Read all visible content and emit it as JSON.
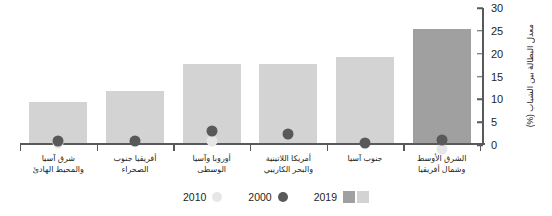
{
  "chart_data": {
    "type": "bar",
    "title": "",
    "xlabel": "",
    "ylabel": "معدل البطالة بين الشباب (%)",
    "ylim": [
      0,
      30
    ],
    "yticks": [
      0,
      5,
      10,
      15,
      20,
      25,
      30
    ],
    "grid": false,
    "legend_position": "bottom-center",
    "categories": [
      "شرق آسيا\nوالمحيط الهادئ",
      "أفريقيا جنوب\nالصحراء",
      "أوروبا وآسيا\nالوسطى",
      "أمريكا اللاتينية\nوالبحر الكاريبي",
      "جنوب آسيا",
      "الشرق الأوسط\nوشمال أفريقيا"
    ],
    "series": [
      {
        "name": "2019",
        "type": "bar",
        "values": [
          9.0,
          11.5,
          17.5,
          17.5,
          19.0,
          25.0
        ]
      },
      {
        "name": "2000",
        "type": "point",
        "values": [
          9.5,
          12.0,
          20.2,
          19.6,
          19.2,
          25.7
        ]
      },
      {
        "name": "2010",
        "type": "point",
        "values": [
          9.2,
          null,
          18.1,
          null,
          null,
          23.8
        ]
      }
    ]
  },
  "axis": {
    "y_title": "معدل البطالة بين الشباب (%)",
    "tick_labels": [
      "0",
      "5",
      "10",
      "15",
      "20",
      "25",
      "30"
    ],
    "category_labels": [
      {
        "line1": "شرق آسيا",
        "line2": "والمحيط الهادئ"
      },
      {
        "line1": "أفريقيا جنوب",
        "line2": "الصحراء"
      },
      {
        "line1": "أوروبا وآسيا",
        "line2": "الوسطى"
      },
      {
        "line1": "أمريكا اللاتينية",
        "line2": "والبحر الكاريبي"
      },
      {
        "line1": "جنوب آسيا",
        "line2": ""
      },
      {
        "line1": "الشرق الأوسط",
        "line2": "وشمال أفريقيا"
      }
    ]
  },
  "legend": {
    "items": [
      {
        "label": "2010",
        "glyph": "circle-light",
        "color": "#e6e6e6"
      },
      {
        "label": "2000",
        "glyph": "circle-dark",
        "color": "#58595b"
      },
      {
        "label": "2019",
        "glyph": "square-pair",
        "color": "#a0a0a0",
        "color2": "#d3d3d3"
      }
    ]
  },
  "colors": {
    "bar_light": "#d3d3d3",
    "bar_dark": "#a0a0a0",
    "marker_2000": "#58595b",
    "marker_2010": "#e6e6e6",
    "axis": "#58595b",
    "text": "#231f20",
    "background": "#ffffff"
  }
}
